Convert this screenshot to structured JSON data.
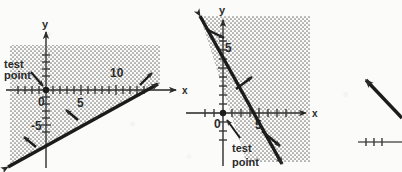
{
  "page": {
    "background_color": "#fbfbf9",
    "ink_color": "#2b2b2b",
    "shade_color": "#8c8c8c"
  },
  "figures": [
    {
      "id": "figure-1",
      "name": "inequality-graph-left",
      "axes": {
        "x_label": "x",
        "y_label": "y",
        "origin_label": "0",
        "x_ticks": [
          "5",
          "10"
        ],
        "y_ticks": [
          "-5"
        ]
      },
      "boundary_line": {
        "style": "solid",
        "slope_sign": "positive",
        "direction": "rises left to right, passes near origin-left and exits upper right"
      },
      "shading": {
        "region": "above the line",
        "pattern": "stipple-dots"
      },
      "callout": {
        "line_1": "test",
        "line_2": "point",
        "points_to": "origin"
      }
    },
    {
      "id": "figure-2",
      "name": "inequality-graph-right",
      "axes": {
        "x_label": "x",
        "y_label": "y",
        "origin_label": "0",
        "x_ticks": [
          "5"
        ],
        "y_ticks": [
          "5"
        ]
      },
      "boundary_line": {
        "style": "solid",
        "slope_sign": "negative",
        "direction": "falls left to right, crosses y-axis above origin and x-axis right of origin"
      },
      "shading": {
        "region": "right of the line",
        "pattern": "stipple-dots"
      },
      "callout": {
        "line_1": "test",
        "line_2": "point",
        "points_to": "origin"
      }
    },
    {
      "id": "figure-3",
      "name": "inequality-graph-cropped",
      "axes": {
        "x_label": "",
        "y_label": "",
        "origin_label": "",
        "x_ticks": [],
        "y_ticks": []
      },
      "boundary_line": {
        "style": "solid",
        "slope_sign": "negative",
        "direction": "partial line entering from the right, cropped by page edge"
      },
      "shading": {
        "region": "not visible",
        "pattern": "none"
      },
      "callout": {
        "line_1": "",
        "line_2": "",
        "points_to": ""
      }
    }
  ]
}
